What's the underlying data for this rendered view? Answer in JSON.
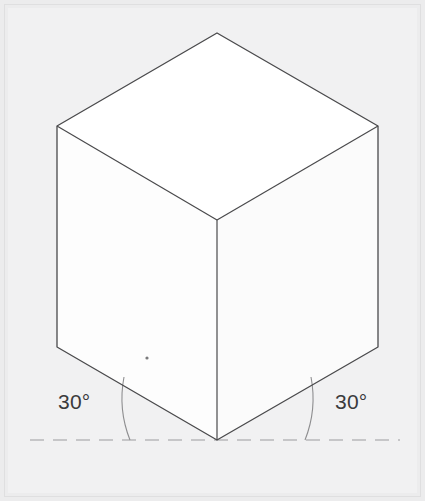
{
  "figure": {
    "name": "isometric-cube-projection",
    "background_color": "#ececed",
    "frame_color": "#e2e2e3",
    "inner_panel_color": "#f2f2f3"
  },
  "cube": {
    "name": "cube",
    "edge_color": "#4a4a4c",
    "edge_width": 1.2,
    "faces": {
      "top": {
        "name": "top-face",
        "fill": "#ffffff",
        "points": "217,33 378,126 217,220 57,126"
      },
      "left": {
        "name": "left-face",
        "fill": "#fdfdfd",
        "points": "57,126 217,220 217,440 57,347"
      },
      "right": {
        "name": "right-face",
        "fill": "#fbfbfb",
        "points": "217,220 378,126 378,347 217,440"
      }
    },
    "vertices": {
      "top": [
        217,
        33
      ],
      "left": [
        57,
        126
      ],
      "right": [
        378,
        126
      ],
      "center": [
        217,
        220
      ],
      "bottom_left": [
        57,
        347
      ],
      "bottom_right": [
        378,
        347
      ],
      "bottom": [
        217,
        440
      ]
    }
  },
  "baseline": {
    "name": "ground-dashed-line",
    "color": "#9a9a9c",
    "y": 440,
    "x_start": 30,
    "x_end": 400,
    "dash_pattern": "14 9"
  },
  "annotations": {
    "left_angle": {
      "label": "30°",
      "label_x": 58,
      "label_y": 409,
      "arc_color": "#8e8e90",
      "arc_path": "M 130 440 A 113 113 0 0 1 124 377"
    },
    "right_angle": {
      "label": "30°",
      "label_x": 335,
      "label_y": 409,
      "arc_color": "#8e8e90",
      "arc_path": "M 305 440 A 113 113 0 0 0 311 377"
    }
  },
  "artifacts": {
    "speck": {
      "name": "scan-speck",
      "x": 147,
      "y": 358,
      "r": 1.6,
      "color": "#7a7a7c"
    }
  }
}
